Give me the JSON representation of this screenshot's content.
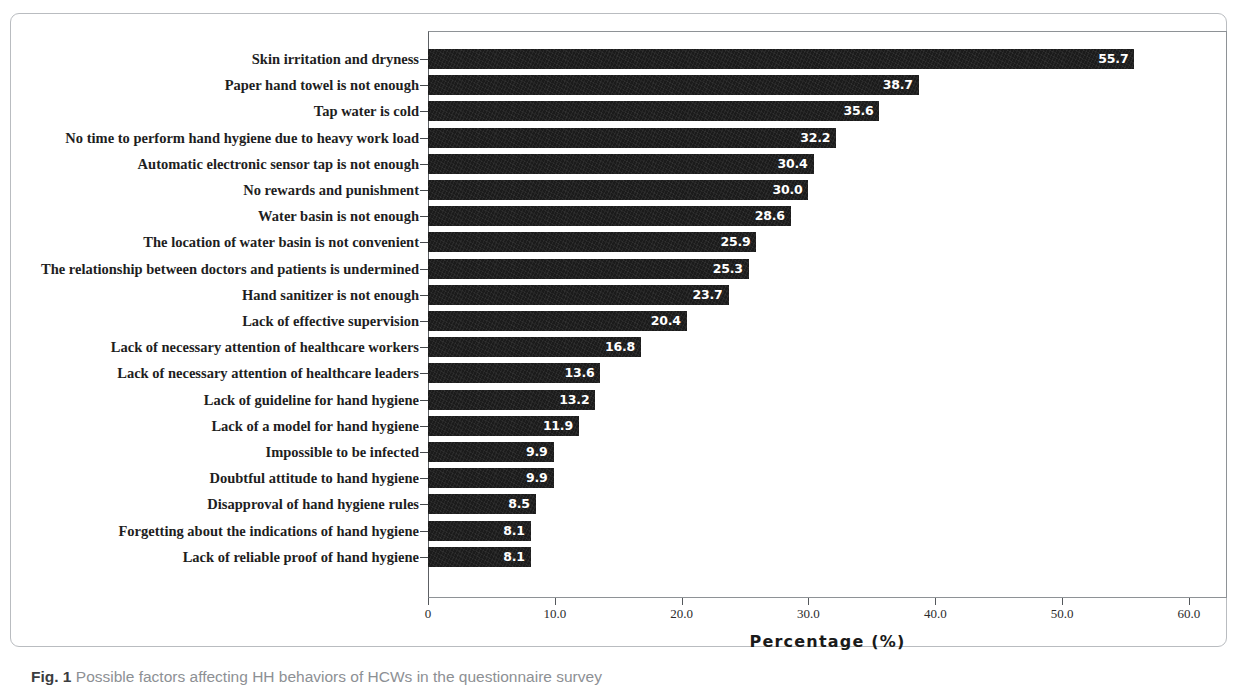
{
  "figure": {
    "caption_prefix": "Fig. 1",
    "caption_text": "Possible factors affecting HH behaviors of HCWs in the questionnaire survey"
  },
  "chart_data": {
    "type": "bar",
    "orientation": "horizontal",
    "title": "",
    "subtitle": "",
    "xlabel": "Percentage (%)",
    "ylabel": "",
    "xlim": [
      0,
      63
    ],
    "xticks": [
      0,
      10,
      20,
      30,
      40,
      50,
      60
    ],
    "xticklabels": [
      "0",
      "10.0",
      "20.0",
      "30.0",
      "40.0",
      "50.0",
      "60.0"
    ],
    "grid": false,
    "legend": false,
    "bar_color": "#1b1b1b",
    "value_label_color": "#ffffff",
    "categories": [
      "Skin irritation and dryness",
      "Paper hand towel is not enough",
      "Tap water is cold",
      "No time to perform hand hygiene due to heavy work load",
      "Automatic electronic sensor tap is not enough",
      "No rewards and punishment",
      "Water basin is not enough",
      "The location of water basin is not convenient",
      "The relationship between doctors and patients is undermined",
      "Hand sanitizer is not enough",
      "Lack of effective supervision",
      "Lack of necessary attention of healthcare workers",
      "Lack of necessary attention of healthcare leaders",
      "Lack of guideline for hand hygiene",
      "Lack of a model  for hand hygiene",
      "Impossible to be infected",
      "Doubtful attitude to hand hygiene",
      "Disapproval of hand hygiene rules",
      "Forgetting about the indications of hand hygiene",
      "Lack of reliable proof of hand hygiene"
    ],
    "values": [
      55.7,
      38.7,
      35.6,
      32.2,
      30.4,
      30.0,
      28.6,
      25.9,
      25.3,
      23.7,
      20.4,
      16.8,
      13.6,
      13.2,
      11.9,
      9.9,
      9.9,
      8.5,
      8.1,
      8.1
    ],
    "value_labels": [
      "55.7",
      "38.7",
      "35.6",
      "32.2",
      "30.4",
      "30.0",
      "28.6",
      "25.9",
      "25.3",
      "23.7",
      "20.4",
      "16.8",
      "13.6",
      "13.2",
      "11.9",
      "9.9",
      "9.9",
      "8.5",
      "8.1",
      "8.1"
    ]
  }
}
